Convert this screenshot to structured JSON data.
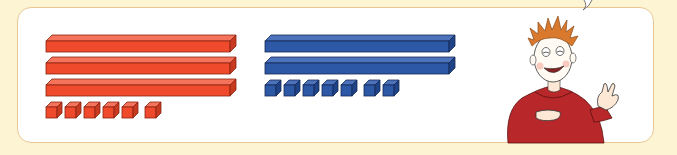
{
  "scene": {
    "description": "Base-ten blocks comparison: red set and blue set, with a cartoon boy gesturing",
    "background_color": "#fcf4d2",
    "panel_border_color": "#eac792"
  },
  "red_set": {
    "color": "#f04a2c",
    "dark_color": "#b8301a",
    "tens": 3,
    "ones": 6,
    "value": 36
  },
  "blue_set": {
    "color": "#2d58a6",
    "dark_color": "#1d3b75",
    "tens": 2,
    "ones": 7,
    "value": 27
  },
  "character": {
    "label": "boy in red hoodie",
    "hair_color": "#d9792e",
    "hoodie_color": "#b8282a"
  }
}
